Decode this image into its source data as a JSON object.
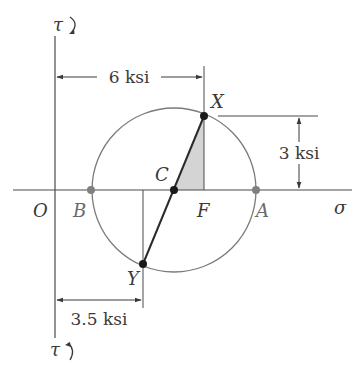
{
  "diagram": {
    "type": "mohr-circle",
    "axes": {
      "origin_label": "O",
      "horizontal_label": "σ",
      "vertical_top_label": "τ",
      "vertical_bottom_label": "τ",
      "top_rotation_symbol": "↻ (clockwise)",
      "bottom_rotation_symbol": "↺ (counterclockwise)"
    },
    "points": {
      "A": "A",
      "B": "B",
      "C": "C",
      "F": "F",
      "X": "X",
      "Y": "Y"
    },
    "dimensions": {
      "horizontal_to_X": "6 ksi",
      "vertical_X_to_axis": "3 ksi",
      "horizontal_to_Y": "3.5 ksi"
    },
    "colors": {
      "line": "#3a3a3a",
      "circle": "#7a7a7a",
      "shade": "#d0d0d0",
      "point_dark": "#1a1a1a",
      "point_gray": "#808080"
    }
  }
}
